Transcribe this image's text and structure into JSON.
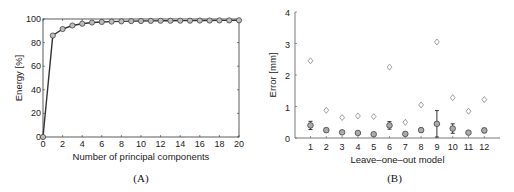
{
  "chart_data": [
    {
      "type": "line",
      "panel_label": "(A)",
      "title": "",
      "xlabel": "Number of principal components",
      "ylabel": "Energy [%]",
      "xlim": [
        0,
        20
      ],
      "ylim": [
        0,
        100
      ],
      "xticks": [
        0,
        2,
        4,
        6,
        8,
        10,
        12,
        14,
        16,
        18,
        20
      ],
      "yticks": [
        0,
        20,
        40,
        60,
        80,
        100
      ],
      "grid": false,
      "marker": "circle",
      "series": [
        {
          "name": "Energy",
          "x": [
            0,
            1,
            2,
            3,
            4,
            5,
            6,
            7,
            8,
            9,
            10,
            11,
            12,
            13,
            14,
            15,
            16,
            17,
            18,
            19,
            20
          ],
          "values": [
            0,
            86,
            91.5,
            94.5,
            96,
            97,
            97.5,
            97.8,
            98,
            98.2,
            98.3,
            98.4,
            98.5,
            98.5,
            98.6,
            98.6,
            98.7,
            98.7,
            98.8,
            98.8,
            98.9
          ]
        }
      ]
    },
    {
      "type": "scatter",
      "panel_label": "(B)",
      "title": "",
      "xlabel": "Leave-one-out model",
      "ylabel": "Error [mm]",
      "xlim": [
        0.5,
        13
      ],
      "ylim": [
        0,
        4
      ],
      "categories": [
        "1",
        "2",
        "3",
        "4",
        "5",
        "6",
        "7",
        "8",
        "9",
        "10",
        "11",
        "12"
      ],
      "yticks": [
        0,
        1,
        2,
        3,
        4
      ],
      "grid": false,
      "series": [
        {
          "name": "Maximum error",
          "marker": "diamond",
          "values": [
            2.45,
            0.88,
            0.65,
            0.7,
            0.68,
            2.25,
            0.5,
            1.05,
            3.05,
            1.28,
            0.85,
            1.22
          ]
        },
        {
          "name": "Mean error",
          "marker": "circle",
          "values": [
            0.4,
            0.25,
            0.18,
            0.16,
            0.12,
            0.4,
            0.13,
            0.25,
            0.45,
            0.3,
            0.17,
            0.24
          ],
          "error": [
            0.13,
            0.06,
            0.04,
            0.04,
            0.03,
            0.12,
            0.03,
            0.06,
            0.42,
            0.15,
            0.04,
            0.07
          ]
        }
      ]
    }
  ]
}
